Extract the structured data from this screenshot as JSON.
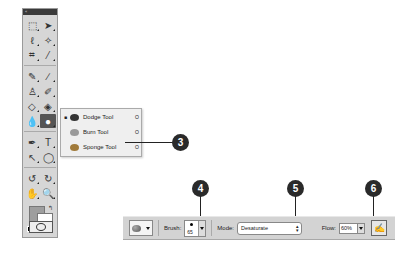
{
  "toolbox": {
    "title": "«",
    "tools": [
      {
        "name": "marquee-tool-icon",
        "glyph": "⬚"
      },
      {
        "name": "move-tool-icon",
        "glyph": "➤"
      },
      {
        "name": "lasso-tool-icon",
        "glyph": "ℓ"
      },
      {
        "name": "magic-wand-tool-icon",
        "glyph": "✧"
      },
      {
        "name": "crop-tool-icon",
        "glyph": "⌗"
      },
      {
        "name": "eyedropper-tool-icon",
        "glyph": "⁄"
      },
      {
        "name": "healing-brush-tool-icon",
        "glyph": "✎"
      },
      {
        "name": "brush-tool-icon",
        "glyph": "∕"
      },
      {
        "name": "clone-stamp-tool-icon",
        "glyph": "♙"
      },
      {
        "name": "history-brush-tool-icon",
        "glyph": "✐"
      },
      {
        "name": "eraser-tool-icon",
        "glyph": "◇"
      },
      {
        "name": "paint-bucket-tool-icon",
        "glyph": "◈"
      },
      {
        "name": "blur-tool-icon",
        "glyph": "💧"
      },
      {
        "name": "dodge-tool-icon",
        "glyph": "●"
      },
      {
        "name": "pen-tool-icon",
        "glyph": "✒"
      },
      {
        "name": "type-tool-icon",
        "glyph": "T"
      },
      {
        "name": "path-selection-tool-icon",
        "glyph": "↖"
      },
      {
        "name": "shape-tool-icon",
        "glyph": "◯"
      },
      {
        "name": "3d-rotate-tool-icon",
        "glyph": "↺"
      },
      {
        "name": "3d-orbit-tool-icon",
        "glyph": "↻"
      },
      {
        "name": "hand-tool-icon",
        "glyph": "✋"
      },
      {
        "name": "zoom-tool-icon",
        "glyph": "🔍"
      }
    ]
  },
  "flyout": {
    "items": [
      {
        "label": "Dodge Tool",
        "key": "O",
        "selected": true,
        "color": "#333333"
      },
      {
        "label": "Burn Tool",
        "key": "O",
        "selected": false,
        "color": "#8a8a8a"
      },
      {
        "label": "Sponge Tool",
        "key": "O",
        "selected": false,
        "color": "#a07a3a"
      }
    ]
  },
  "callouts": {
    "c3": "3",
    "c4": "4",
    "c5": "5",
    "c6": "6"
  },
  "options_bar": {
    "brush_label": "Brush:",
    "brush_size": "65",
    "mode_label": "Mode:",
    "mode_value": "Desaturate",
    "flow_label": "Flow:",
    "flow_value": "60%"
  }
}
